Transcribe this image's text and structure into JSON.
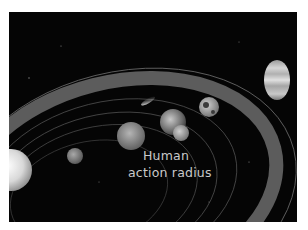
{
  "image": {
    "subject": "Solar system illustration with highlighted band",
    "caption_lines": [
      "Human",
      "action  radius"
    ],
    "colors": {
      "background": "#050505",
      "band": "#5a5a5a",
      "orbit_lines": "#6e6e6e",
      "label_text": "#c9c9c9",
      "page": "#ffffff"
    },
    "bodies": [
      {
        "name": "sun",
        "label": ""
      },
      {
        "name": "mercury",
        "label": ""
      },
      {
        "name": "venus",
        "label": ""
      },
      {
        "name": "earth",
        "label": ""
      },
      {
        "name": "moon",
        "label": ""
      },
      {
        "name": "mars",
        "label": ""
      },
      {
        "name": "comet",
        "label": ""
      },
      {
        "name": "jupiter",
        "label": ""
      }
    ]
  }
}
